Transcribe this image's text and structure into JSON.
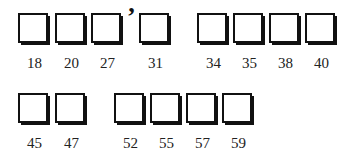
{
  "rows": [
    {
      "groups": [
        {
          "items": [
            {
              "label": "18",
              "x": 18
            },
            {
              "label": "20",
              "x": 55
            },
            {
              "label": "27",
              "x": 91
            }
          ]
        },
        {
          "items": [
            {
              "label": "31",
              "x": 139
            }
          ],
          "prefix_mark": "’"
        },
        {
          "items": [
            {
              "label": "34",
              "x": 197
            },
            {
              "label": "35",
              "x": 233
            },
            {
              "label": "38",
              "x": 269
            },
            {
              "label": "40",
              "x": 305
            }
          ]
        }
      ],
      "y": 13
    },
    {
      "groups": [
        {
          "items": [
            {
              "label": "45",
              "x": 18
            },
            {
              "label": "47",
              "x": 55
            }
          ]
        },
        {
          "items": [
            {
              "label": "52",
              "x": 114
            },
            {
              "label": "55",
              "x": 150
            },
            {
              "label": "57",
              "x": 186
            },
            {
              "label": "59",
              "x": 222
            }
          ]
        }
      ],
      "y": 93
    }
  ],
  "apostrophe": {
    "text": "’",
    "x": 127,
    "y": 4
  },
  "labels": [
    "18",
    "20",
    "27",
    "31",
    "34",
    "35",
    "38",
    "40",
    "45",
    "47",
    "52",
    "55",
    "57",
    "59"
  ]
}
